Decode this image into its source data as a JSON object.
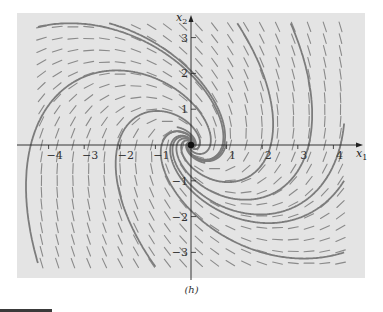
{
  "figure": {
    "caption": "(h)",
    "panel_color": "#e4e4e4",
    "trajectory_color": "#7c7c7c",
    "field_color": "#8a8a8a",
    "axis_color": "#222222"
  },
  "chart_data": {
    "type": "phase_portrait",
    "title": "",
    "xlabel": "x1",
    "ylabel": "x2",
    "xlabel_main": "x",
    "xlabel_sub": "1",
    "ylabel_main": "x",
    "ylabel_sub": "2",
    "xlim": [
      -4.8,
      4.8
    ],
    "ylim": [
      -3.7,
      3.5
    ],
    "x_ticks": [
      -4,
      -3,
      -2,
      -1,
      1,
      2,
      3,
      4
    ],
    "y_ticks": [
      -3,
      -2,
      -1,
      1,
      2,
      3
    ],
    "x_tick_labels": [
      "−4",
      "−3",
      "−2",
      "−1",
      "1",
      "2",
      "3",
      "4"
    ],
    "y_tick_labels": [
      "−3",
      "−2",
      "−1",
      "1",
      "2",
      "3"
    ],
    "system_matrix": [
      [
        -0.25,
        1
      ],
      [
        -1,
        -1
      ]
    ],
    "equilibrium": [
      0,
      0
    ],
    "equilibrium_type": "stable spiral (clockwise)",
    "direction_field": {
      "x_range": [
        -4.2,
        4.2
      ],
      "y_range": [
        -3.3,
        3.3
      ],
      "columns": 20,
      "rows": 21
    },
    "trajectory_starts": [
      [
        -4.3,
        3.3
      ],
      [
        -2.3,
        3.4
      ],
      [
        1.3,
        3.4
      ],
      [
        2.8,
        3.4
      ],
      [
        4.3,
        -3.0
      ],
      [
        4.3,
        -1.0
      ],
      [
        4.3,
        0.6
      ],
      [
        -4.3,
        -3.3
      ],
      [
        -1.0,
        -3.4
      ],
      [
        1.0,
        0.1
      ],
      [
        -0.8,
        0.1
      ],
      [
        0.4,
        -0.5
      ],
      [
        -0.4,
        0.5
      ]
    ]
  }
}
